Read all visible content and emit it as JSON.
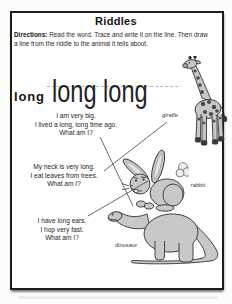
{
  "worksheet": {
    "title": "Riddles",
    "directions": {
      "label": "Directions:",
      "line1": " Read the word. Trace and write it on the line. Then draw",
      "line2": "a line from the riddle to the animal it tells about."
    }
  },
  "trace_row": {
    "word_label": "long",
    "traced_text": "long long"
  },
  "riddles": [
    {
      "line1": "I am very big.",
      "line2": "I lived a long, long time ago.",
      "line3": "What am I?",
      "answer": "dinosaur"
    },
    {
      "line1": "My neck is very long.",
      "line2": "I eat leaves from trees.",
      "line3": "What am I?",
      "answer": "giraffe"
    },
    {
      "line1": "I have long ears.",
      "line2": "I hop very fast.",
      "line3": "What am I?",
      "answer": "rabbit"
    }
  ],
  "animal_labels": {
    "giraffe": "giraffe",
    "rabbit": "rabbit",
    "dinosaur": "dinosaur"
  },
  "colors": {
    "ink": "#1f1f1f",
    "animal_fill": "#c8c8c8",
    "animal_outline": "#333333",
    "spot_dark": "#4a4a4a",
    "guide_dash": "#b4b4b0",
    "answer_line": "#444444"
  }
}
